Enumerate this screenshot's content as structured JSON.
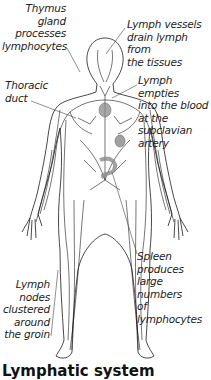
{
  "diagram": {
    "title": "Lymphatic system",
    "labels": {
      "thymus": [
        "Thymus",
        "gland",
        "processes",
        "lymphocytes"
      ],
      "vessels": [
        "Lymph vessels",
        "drain lymph from",
        "the tissues"
      ],
      "thoracic": [
        "Thoracic",
        "duct"
      ],
      "empties": [
        "Lymph empties",
        "into the blood",
        "at the",
        "subclavian",
        "artery"
      ],
      "spleen": [
        "Spleen",
        "produces large",
        "numbers",
        "of lymphocytes"
      ],
      "nodes": [
        "Lymph",
        "nodes",
        "clustered",
        "around",
        "the groin"
      ]
    },
    "colors": {
      "line": "#1a1a1a",
      "organ_fill": "#8a8a8a",
      "leader_line": "#444444",
      "background": "#ffffff"
    }
  }
}
